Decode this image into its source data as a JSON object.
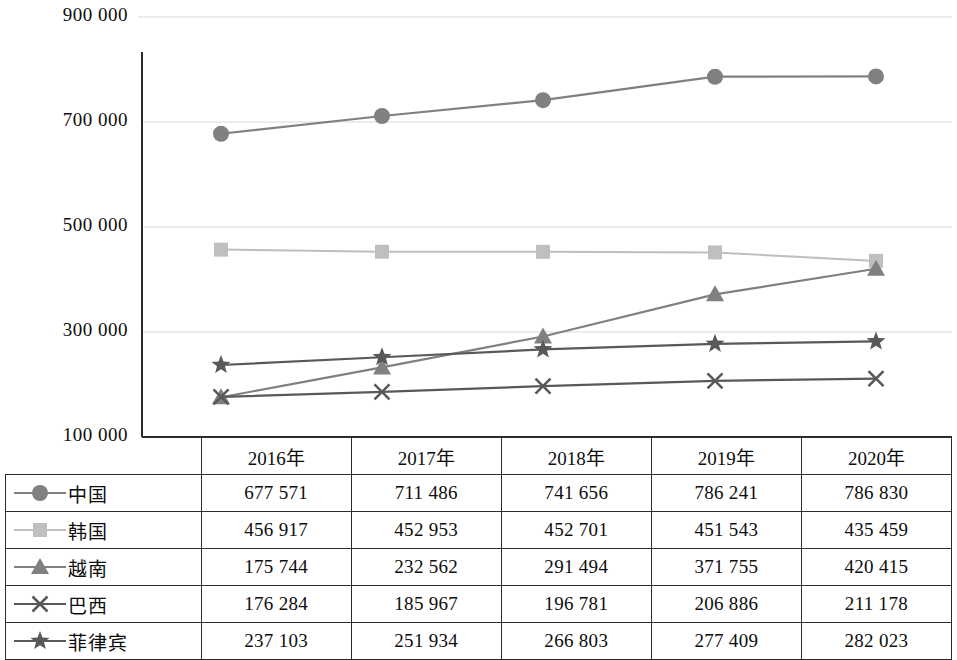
{
  "chart_data": {
    "type": "line",
    "title": "",
    "xlabel": "",
    "ylabel": "",
    "categories": [
      "2016年",
      "2017年",
      "2018年",
      "2019年",
      "2020年"
    ],
    "ylim": [
      100000,
      900000
    ],
    "yticks": [
      "900 000",
      "700 000",
      "500 000",
      "300 000",
      "100 000"
    ],
    "ytick_values": [
      900000,
      700000,
      500000,
      300000,
      100000
    ],
    "grid": true,
    "legend_position": "table-left",
    "series": [
      {
        "name": "中国",
        "marker": "circle",
        "color": "#808080",
        "values": [
          677571,
          711486,
          741656,
          786241,
          786830
        ],
        "labels": [
          "677 571",
          "711 486",
          "741 656",
          "786 241",
          "786 830"
        ]
      },
      {
        "name": "韩国",
        "marker": "square",
        "color": "#bfbfbf",
        "values": [
          456917,
          452953,
          452701,
          451543,
          435459
        ],
        "labels": [
          "456 917",
          "452 953",
          "452 701",
          "451 543",
          "435 459"
        ]
      },
      {
        "name": "越南",
        "marker": "triangle",
        "color": "#808080",
        "values": [
          175744,
          232562,
          291494,
          371755,
          420415
        ],
        "labels": [
          "175 744",
          "232 562",
          "291 494",
          "371 755",
          "420 415"
        ]
      },
      {
        "name": "巴西",
        "marker": "cross",
        "color": "#595959",
        "values": [
          176284,
          185967,
          196781,
          206886,
          211178
        ],
        "labels": [
          "176 284",
          "185 967",
          "196 781",
          "206 886",
          "211 178"
        ]
      },
      {
        "name": "菲律宾",
        "marker": "star",
        "color": "#595959",
        "values": [
          237103,
          251934,
          266803,
          277409,
          282023
        ],
        "labels": [
          "237 103",
          "251 934",
          "266 803",
          "277 409",
          "282 023"
        ]
      }
    ]
  },
  "colors": {
    "axis": "#2b2b2b",
    "grid": "#d9d9d9",
    "text": "#0d0d0d"
  }
}
